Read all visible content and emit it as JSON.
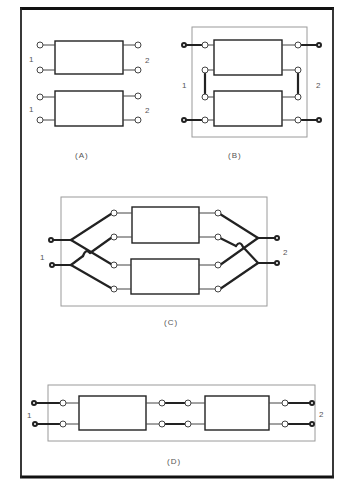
{
  "figure": {
    "panels": [
      {
        "id": "A",
        "caption": "(A)",
        "description": "Two separate two-port networks",
        "networks": [
          {
            "port_in_label": "1",
            "port_out_label": "2"
          },
          {
            "port_in_label": "1",
            "port_out_label": "2"
          }
        ]
      },
      {
        "id": "B",
        "caption": "(B)",
        "description": "Series connection of two two-port networks",
        "port_in_label": "1",
        "port_out_label": "2"
      },
      {
        "id": "C",
        "caption": "(C)",
        "description": "Parallel connection of two two-port networks",
        "port_in_label": "1",
        "port_out_label": "2"
      },
      {
        "id": "D",
        "caption": "(D)",
        "description": "Cascade connection of two two-port networks",
        "port_in_label": "1",
        "port_out_label": "2"
      }
    ]
  },
  "colors": {
    "line": "#222222",
    "thin_frame": "#9a9a9a",
    "text": "#555555",
    "background": "#ffffff"
  }
}
